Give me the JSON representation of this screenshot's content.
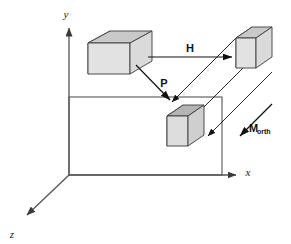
{
  "figure": {
    "background_color": "#ffffff",
    "width": 291,
    "height": 244
  },
  "axes": {
    "color": "#555555",
    "origin": {
      "x": 69,
      "y": 175
    },
    "items": [
      {
        "name": "y-axis",
        "label": "y",
        "label_x": 66,
        "label_y": 18,
        "tip_x": 69,
        "tip_y": 22
      },
      {
        "name": "x-axis",
        "label": "x",
        "label_x": 248,
        "label_y": 176,
        "tip_x": 243,
        "tip_y": 175
      },
      {
        "name": "z-axis",
        "label": "z",
        "label_x": 9,
        "label_y": 238,
        "tip_x": 20,
        "tip_y": 221
      }
    ]
  },
  "view_volume": {
    "name": "projection-rectangle",
    "stroke": "#555555",
    "x": 69,
    "y": 97,
    "width": 153,
    "height": 78
  },
  "boxes": [
    {
      "name": "source-box",
      "role": "original object in world space",
      "front_face_color": "#e2e2e2",
      "top_face_color": "#c9c9c9",
      "side_face_color": "#6d6d6d",
      "outline_color": "#3a3a3a"
    },
    {
      "name": "transformed-box",
      "role": "object after H transform",
      "front_face_color": "#e2e2e2",
      "top_face_color": "#c9c9c9",
      "side_face_color": "#6d6d6d",
      "outline_color": "#3a3a3a"
    },
    {
      "name": "projected-box",
      "role": "object after orthographic projection",
      "front_face_color": "#dcdcdc",
      "top_face_color": "#b4b4b4",
      "side_face_color": "#8a8a8a",
      "outline_color": "#3a3a3a"
    }
  ],
  "vectors": [
    {
      "name": "h-arrow",
      "label": "H",
      "subscript": "",
      "label_x": 190,
      "label_y": 53,
      "from_x": 148,
      "from_y": 57,
      "to_x": 233,
      "to_y": 57,
      "color": "#111111"
    },
    {
      "name": "p-arrow",
      "label": "P",
      "subscript": "",
      "label_x": 164,
      "label_y": 87,
      "from_x": 136,
      "from_y": 65,
      "to_x": 172,
      "to_y": 103,
      "color": "#111111"
    },
    {
      "name": "morth-arrow",
      "label": "M",
      "subscript": "orth",
      "label_x": 249,
      "label_y": 132,
      "from_x": 272,
      "from_y": 104,
      "to_x": 238,
      "to_y": 138,
      "color": "#111111"
    }
  ],
  "projection_rays": [
    {
      "name": "projection-ray-top",
      "from_x": 236,
      "from_y": 38,
      "to_x": 168,
      "to_y": 106
    },
    {
      "name": "projection-ray-middle",
      "from_x": 253,
      "from_y": 58,
      "to_x": 185,
      "to_y": 126
    },
    {
      "name": "projection-ray-bottom",
      "from_x": 272,
      "from_y": 72,
      "to_x": 204,
      "to_y": 140
    }
  ]
}
